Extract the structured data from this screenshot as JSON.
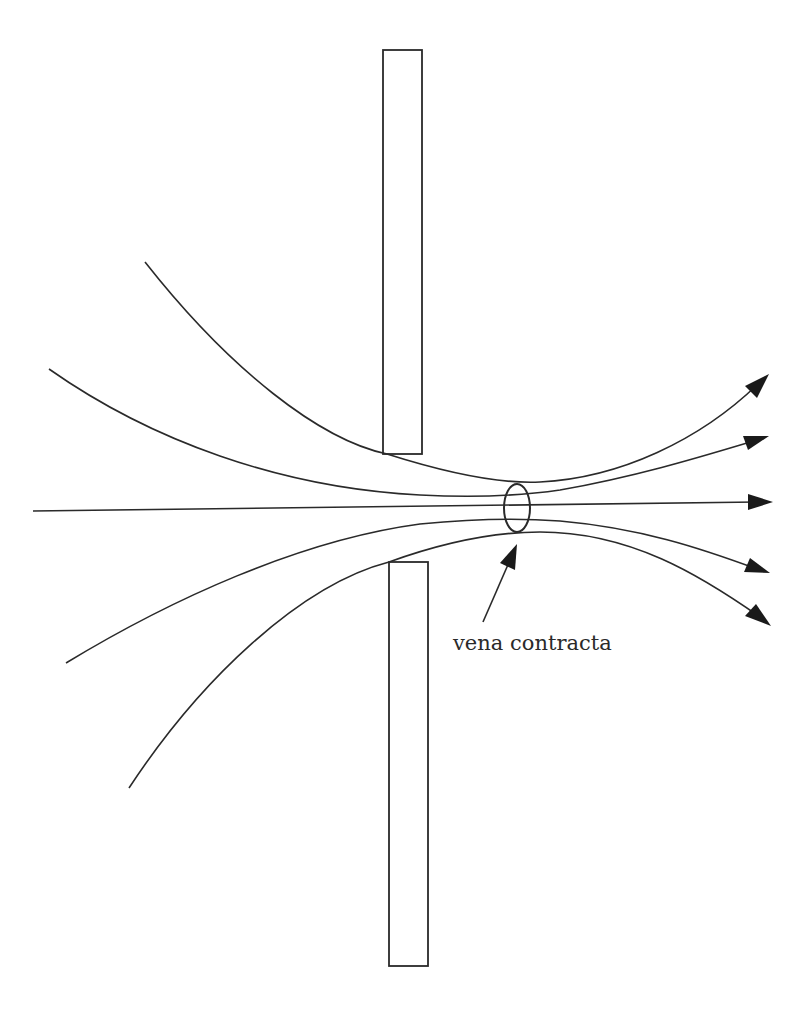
{
  "diagram": {
    "label": "vena contracta",
    "colors": {
      "line": "#2a2a2a",
      "arrowhead": "#1a1a1a",
      "background": "#ffffff"
    },
    "plates": [
      {
        "name": "upper-plate",
        "x": 383,
        "y": 50,
        "width": 39,
        "height": 404
      },
      {
        "name": "lower-plate",
        "x": 389,
        "y": 562,
        "width": 39,
        "height": 404
      }
    ],
    "streamlines": [
      {
        "name": "streamline-1",
        "start": [
          145,
          262
        ],
        "end": [
          769,
          374
        ]
      },
      {
        "name": "streamline-2",
        "start": [
          49,
          369
        ],
        "end": [
          769,
          436
        ]
      },
      {
        "name": "streamline-center",
        "start": [
          33,
          511
        ],
        "end": [
          773,
          502
        ]
      },
      {
        "name": "streamline-4",
        "start": [
          66,
          663
        ],
        "end": [
          770,
          573
        ]
      },
      {
        "name": "streamline-5",
        "start": [
          129,
          788
        ],
        "end": [
          771,
          626
        ]
      }
    ],
    "vena_contracta_marker": {
      "cx": 517,
      "cy": 508,
      "rx": 13,
      "ry": 24
    },
    "label_arrow": {
      "from": [
        483,
        622
      ],
      "to": [
        517,
        542
      ]
    }
  }
}
